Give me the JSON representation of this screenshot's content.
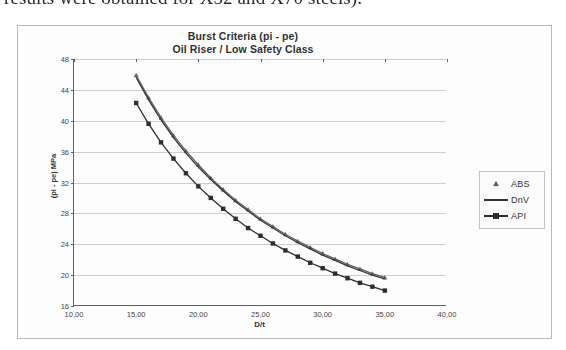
{
  "page": {
    "top_text_line": "results were obtained for X52 and X70 steels)."
  },
  "chart": {
    "title_line1": "Burst Criteria (pi - pe)",
    "title_line2": "Oil Riser / Low Safety Class",
    "x_axis_title": "D/t",
    "y_axis_title": "(pi - pe) MPa"
  },
  "legend": {
    "items": [
      {
        "label": "ABS",
        "marker": "triangle-marker",
        "color": "#4c4c4c"
      },
      {
        "label": "DnV",
        "marker": "line-marker",
        "color": "#1a1a1a"
      },
      {
        "label": "API",
        "marker": "square-marker",
        "color": "#121212"
      }
    ]
  },
  "chart_data": {
    "type": "line",
    "xlabel": "D/t",
    "ylabel": "(pi - pe) MPa",
    "xlim": [
      10.0,
      40.0
    ],
    "ylim": [
      16,
      48
    ],
    "xticks": [
      "10,00",
      "15,00",
      "20,00",
      "25,00",
      "30,00",
      "35,00",
      "40,00"
    ],
    "xtick_values": [
      10,
      15,
      20,
      25,
      30,
      35,
      40
    ],
    "yticks": [
      "16",
      "20",
      "24",
      "28",
      "32",
      "36",
      "40",
      "44",
      "48"
    ],
    "ytick_values": [
      16,
      20,
      24,
      28,
      32,
      36,
      40,
      44,
      48
    ],
    "grid": "horizontal",
    "legend_position": "right",
    "x": [
      15,
      16,
      17,
      18,
      19,
      20,
      21,
      22,
      23,
      24,
      25,
      26,
      27,
      28,
      29,
      30,
      31,
      32,
      33,
      34,
      35
    ],
    "series": [
      {
        "name": "ABS",
        "marker": "triangle",
        "color": "#4c4c4c",
        "values": [
          45.9,
          43.0,
          40.4,
          38.1,
          36.1,
          34.3,
          32.6,
          31.1,
          29.7,
          28.5,
          27.3,
          26.3,
          25.3,
          24.4,
          23.6,
          22.8,
          22.1,
          21.4,
          20.8,
          20.2,
          19.7
        ]
      },
      {
        "name": "DnV",
        "marker": "none",
        "color": "#1a1a1a",
        "values": [
          45.6,
          42.7,
          40.1,
          37.8,
          35.8,
          34.0,
          32.4,
          30.9,
          29.5,
          28.3,
          27.1,
          26.1,
          25.1,
          24.2,
          23.4,
          22.6,
          21.9,
          21.2,
          20.6,
          20.0,
          19.5
        ]
      },
      {
        "name": "API",
        "marker": "square",
        "color": "#121212",
        "values": [
          42.3,
          39.6,
          37.2,
          35.1,
          33.2,
          31.5,
          30.0,
          28.6,
          27.3,
          26.1,
          25.1,
          24.1,
          23.2,
          22.4,
          21.6,
          20.9,
          20.2,
          19.6,
          19.0,
          18.5,
          18.0
        ]
      }
    ]
  }
}
